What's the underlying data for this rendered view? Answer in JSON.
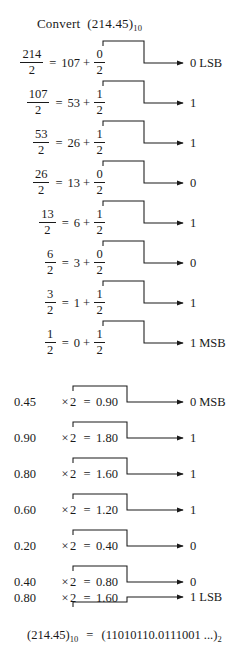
{
  "title": {
    "label": "Convert",
    "value": "(214.45)",
    "subscript": "10"
  },
  "integer_rows": [
    {
      "dividend": "214",
      "divisor": "2",
      "quotient": "107",
      "rem_num": "0",
      "rem_den": "2",
      "bit": "0",
      "tag": "LSB"
    },
    {
      "dividend": "107",
      "divisor": "2",
      "quotient": "53",
      "rem_num": "1",
      "rem_den": "2",
      "bit": "1",
      "tag": ""
    },
    {
      "dividend": "53",
      "divisor": "2",
      "quotient": "26",
      "rem_num": "1",
      "rem_den": "2",
      "bit": "1",
      "tag": ""
    },
    {
      "dividend": "26",
      "divisor": "2",
      "quotient": "13",
      "rem_num": "0",
      "rem_den": "2",
      "bit": "0",
      "tag": ""
    },
    {
      "dividend": "13",
      "divisor": "2",
      "quotient": "6",
      "rem_num": "1",
      "rem_den": "2",
      "bit": "1",
      "tag": ""
    },
    {
      "dividend": "6",
      "divisor": "2",
      "quotient": "3",
      "rem_num": "0",
      "rem_den": "2",
      "bit": "0",
      "tag": ""
    },
    {
      "dividend": "3",
      "divisor": "2",
      "quotient": "1",
      "rem_num": "1",
      "rem_den": "2",
      "bit": "1",
      "tag": ""
    },
    {
      "dividend": "1",
      "divisor": "2",
      "quotient": "0",
      "rem_num": "1",
      "rem_den": "2",
      "bit": "1",
      "tag": "MSB"
    }
  ],
  "fraction_rows": [
    {
      "operand": "0.45",
      "times": "×",
      "factor": "2",
      "equals": "=",
      "result": "0.90",
      "bit": "0",
      "tag": "MSB"
    },
    {
      "operand": "0.90",
      "times": "×",
      "factor": "2",
      "equals": "=",
      "result": "1.80",
      "bit": "1",
      "tag": ""
    },
    {
      "operand": "0.80",
      "times": "×",
      "factor": "2",
      "equals": "=",
      "result": "1.60",
      "bit": "1",
      "tag": ""
    },
    {
      "operand": "0.60",
      "times": "×",
      "factor": "2",
      "equals": "=",
      "result": "1.20",
      "bit": "1",
      "tag": ""
    },
    {
      "operand": "0.20",
      "times": "×",
      "factor": "2",
      "equals": "=",
      "result": "0.40",
      "bit": "0",
      "tag": ""
    },
    {
      "operand": "0.40",
      "times": "×",
      "factor": "2",
      "equals": "=",
      "result": "0.80",
      "bit": "0",
      "tag": ""
    },
    {
      "operand": "0.80",
      "times": "×",
      "factor": "2",
      "equals": "=",
      "result": "1.60",
      "bit": "1",
      "tag": "LSB"
    }
  ],
  "answer": {
    "lhs": "(214.45)",
    "lhs_sub": "10",
    "equals": "=",
    "rhs": "(11010110.0111001 ...)",
    "rhs_sub": "2"
  },
  "symbols": {
    "equals": "=",
    "plus": "+"
  },
  "colors": {
    "ink": "#1a1a1a",
    "background": "#ffffff"
  }
}
